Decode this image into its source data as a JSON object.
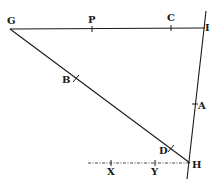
{
  "diagram": {
    "type": "geometric-construction",
    "points": {
      "G": {
        "label": "G",
        "x": 10,
        "y": 29
      },
      "P": {
        "label": "P",
        "x": 92,
        "y": 29
      },
      "C": {
        "label": "C",
        "x": 171,
        "y": 28
      },
      "I": {
        "label": "I",
        "x": 203,
        "y": 28
      },
      "B": {
        "label": "B",
        "x": 76,
        "y": 80
      },
      "D": {
        "label": "D",
        "x": 171,
        "y": 150
      },
      "A": {
        "label": "A",
        "x": 195,
        "y": 106
      },
      "H": {
        "label": "H",
        "x": 190,
        "y": 163
      },
      "X": {
        "label": "X",
        "x": 111,
        "y": 163
      },
      "Y": {
        "label": "Y",
        "x": 155,
        "y": 163
      }
    },
    "segments": [
      {
        "from": "G",
        "to": "I",
        "style": "solid"
      },
      {
        "from": "G",
        "to": "H",
        "style": "solid"
      },
      {
        "from": "I",
        "to": "H",
        "style": "solid",
        "extended": true
      },
      {
        "from": "X",
        "to": "H",
        "style": "dotted",
        "extended_left": true
      }
    ]
  }
}
